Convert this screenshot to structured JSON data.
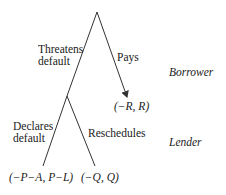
{
  "diagram": {
    "type": "game-tree",
    "players": {
      "borrower": "Borrower",
      "lender": "Lender"
    },
    "nodes": {
      "root": {
        "player": "Borrower"
      },
      "second": {
        "player": "Lender"
      }
    },
    "actions": {
      "threatens_default_line1": "Threatens",
      "threatens_default_line2": "default",
      "pays": "Pays",
      "declares_default_line1": "Declares",
      "declares_default_line2": "default",
      "reschedules": "Reschedules"
    },
    "payoffs": {
      "pays": "(−R, R)",
      "declares_default": "(−P−A, P−L)",
      "reschedules": "(−Q, Q)"
    },
    "colors": {
      "line": "#333333",
      "text": "#1a1a1a",
      "background": "#ffffff"
    }
  }
}
